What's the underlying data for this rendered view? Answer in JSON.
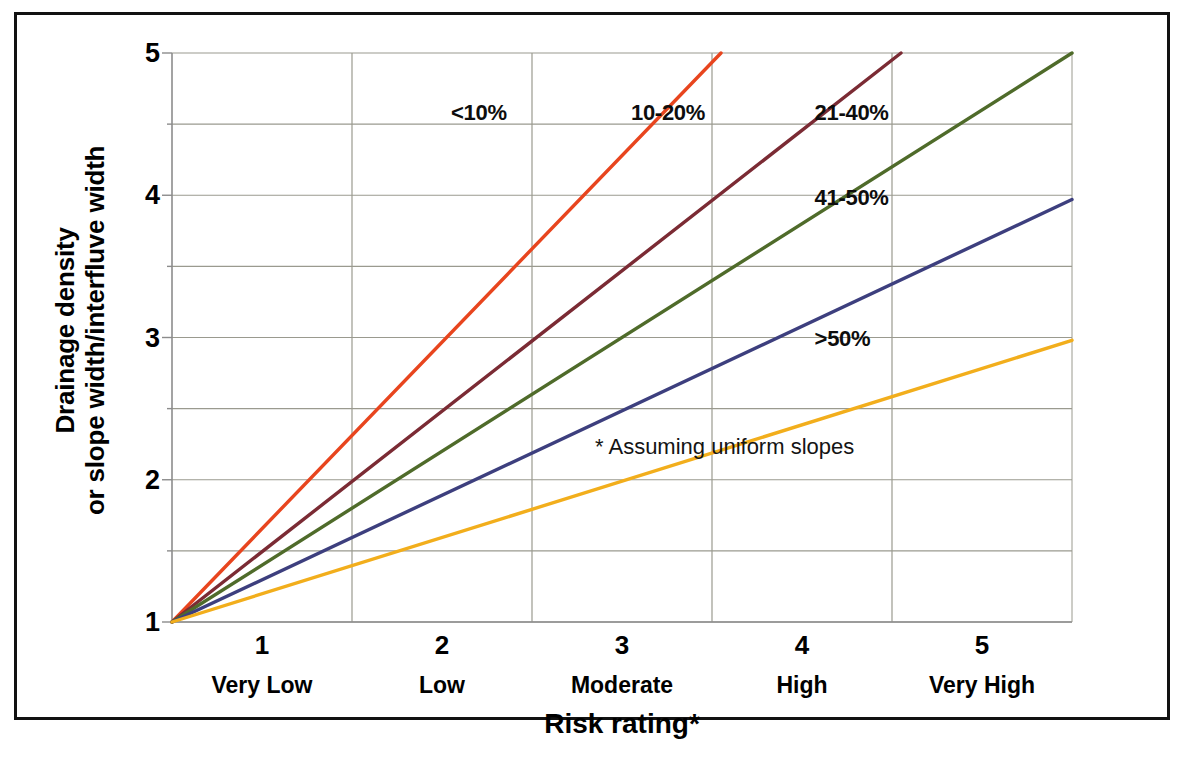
{
  "chart_data": {
    "type": "line",
    "title": "",
    "subtitle": "",
    "xlabel": "Risk rating*",
    "ylabel_line1": "Drainage density",
    "ylabel_line2": "or slope width/interfluve width",
    "xlim": [
      0.5,
      5.5
    ],
    "ylim": [
      1,
      5
    ],
    "grid": true,
    "y_ticks": [
      1,
      2,
      3,
      4,
      5
    ],
    "y_tick_labels": [
      "1",
      "2",
      "3",
      "4",
      "5"
    ],
    "y_gridlines": [
      1,
      1.5,
      2,
      2.5,
      3,
      3.5,
      4,
      4.5,
      5
    ],
    "x_ticks": [
      1,
      2,
      3,
      4,
      5
    ],
    "x_tick_labels": [
      "1",
      "2",
      "3",
      "4",
      "5"
    ],
    "x_category_labels": [
      "Very Low",
      "Low",
      "Moderate",
      "High",
      "Very High"
    ],
    "x_gridlines": [
      1.5,
      2.5,
      3.5,
      4.5
    ],
    "legend_position": "inline-labels",
    "annotation": "* Assuming uniform slopes",
    "series": [
      {
        "name": "<10%",
        "color": "#E8451E",
        "x": [
          0.5,
          3.55
        ],
        "values": [
          1,
          5
        ],
        "label_x": 2.05,
        "label_y": 4.67
      },
      {
        "name": "10-20%",
        "color": "#7B2B34",
        "x": [
          0.5,
          4.55
        ],
        "values": [
          1,
          5
        ],
        "label_x": 3.05,
        "label_y": 4.67
      },
      {
        "name": "21-40%",
        "color": "#4F6B2A",
        "x": [
          0.5,
          5.5
        ],
        "values": [
          1,
          5
        ],
        "label_x": 4.07,
        "label_y": 4.67
      },
      {
        "name": "41-50%",
        "color": "#3D3F7E",
        "x": [
          0.5,
          5.5
        ],
        "values": [
          1,
          3.97
        ],
        "label_x": 4.07,
        "label_y": 4.07
      },
      {
        "name": ">50%",
        "color": "#F2AE1C",
        "x": [
          0.5,
          5.5
        ],
        "values": [
          1,
          2.98
        ],
        "label_x": 4.07,
        "label_y": 3.08
      }
    ],
    "axis_color": "#8C8C8C",
    "gridline_color": "#9A9A8F",
    "plot_background": "#FFFFFF",
    "frame_color": "#121212"
  }
}
